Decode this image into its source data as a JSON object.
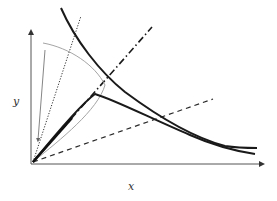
{
  "diagram": {
    "axes": {
      "x_label": "x",
      "y_label": "y"
    },
    "colors": {
      "background": "#ffffff",
      "axis": "#555555",
      "curve": "#1a1a1a",
      "thin_curve": "#9a9a9a",
      "dashed": "#2a2a2a"
    },
    "elements": [
      {
        "name": "upper-thick-curve",
        "style": "solid-thick"
      },
      {
        "name": "lower-thick-curve",
        "style": "solid-thick"
      },
      {
        "name": "dash-dot-line",
        "style": "dash-dot"
      },
      {
        "name": "dotted-line",
        "style": "dotted"
      },
      {
        "name": "dashed-line",
        "style": "dashed"
      },
      {
        "name": "thin-gray-curve",
        "style": "thin-solid"
      },
      {
        "name": "thin-arrow-line",
        "style": "thin-arrow"
      }
    ]
  }
}
